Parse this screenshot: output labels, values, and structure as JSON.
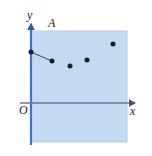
{
  "figure": {
    "type": "scatter-diagram",
    "width": 152,
    "height": 156,
    "background_color": "#ffffff"
  },
  "labels": {
    "y_axis": "y",
    "x_axis": "x",
    "origin": "O",
    "region": "A"
  },
  "colors": {
    "shaded_region": "#c3daf1",
    "shaded_region_edge": "#b4cfea",
    "y_axis_line": "#3f76c4",
    "x_axis_line": "#5b6b86",
    "point_fill": "#1c1c30",
    "connector_line": "#555566"
  },
  "chart_data": {
    "type": "scatter",
    "title": "",
    "xlabel": "x",
    "ylabel": "y",
    "grid": false,
    "legend": false,
    "xlim": [
      0,
      10
    ],
    "ylim": [
      0,
      7
    ],
    "annotations": [
      {
        "text": "A",
        "x": 1.9,
        "y": 6.6
      },
      {
        "text": "O",
        "x": -0.35,
        "y": -0.35
      }
    ],
    "region": {
      "label": "A",
      "x_range": [
        0,
        9.9
      ],
      "y_range": [
        -2.4,
        6.2
      ],
      "fill": "#c3daf1"
    },
    "points_px": [
      {
        "x": 31,
        "y": 52
      },
      {
        "x": 52,
        "y": 61
      },
      {
        "x": 70,
        "y": 66
      },
      {
        "x": 87,
        "y": 60
      },
      {
        "x": 113,
        "y": 44
      }
    ],
    "series": [
      {
        "name": "data",
        "x": [
          0.0,
          2.2,
          4.0,
          5.8,
          8.5
        ],
        "y": [
          3.9,
          3.1,
          2.7,
          3.2,
          4.5
        ],
        "marker": "circle",
        "marker_color": "#1c1c30"
      }
    ],
    "connector_segment": {
      "from_px": {
        "x": 31,
        "y": 52
      },
      "to_px": {
        "x": 52,
        "y": 61
      },
      "from": {
        "x": 0.0,
        "y": 3.9
      },
      "to": {
        "x": 2.2,
        "y": 3.1
      }
    }
  },
  "geometry": {
    "shaded_rect_px": {
      "x": 31,
      "y": 31,
      "width": 96,
      "height": 111
    },
    "y_axis_px": {
      "x": 31,
      "y_top": 24,
      "y_bottom": 145
    },
    "x_axis_px": {
      "y": 103,
      "x_left": 20,
      "x_right": 134
    }
  }
}
